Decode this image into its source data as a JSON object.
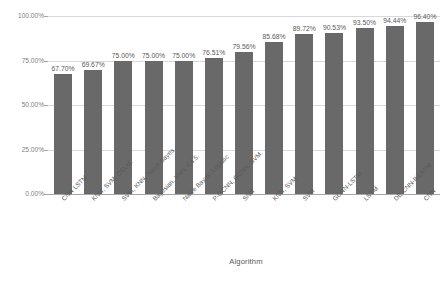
{
  "chart_data": {
    "type": "bar",
    "title": "",
    "xlabel": "Algorithm",
    "ylabel": "Average Accuracy",
    "ylim": [
      0,
      100
    ],
    "grid": true,
    "legend": "none",
    "orientation": "vertical",
    "bar_color": "#696969",
    "value_label_format": "percent-2dp",
    "categories": [
      "CNN LSTM",
      "KNN, SVM, OELM.",
      "SVM, KNN, Naive Bayes.",
      "Bayesian, KNN, C4.5.",
      "Naive Bayes, Logistic",
      "P-GCNN, GCNN, SVM.",
      "SNN",
      "KNN, SVM",
      "SVM",
      "GCNN-LSTM",
      "LSTM",
      "DE-CNN-BiLSTM",
      "CNN"
    ],
    "values": [
      67.7,
      69.67,
      75.0,
      75.0,
      75.0,
      76.51,
      79.56,
      85.68,
      89.72,
      90.53,
      93.5,
      94.44,
      96.4
    ],
    "value_labels": [
      "67.70%",
      "69.67%",
      "75.00%",
      "75.00%",
      "75.00%",
      "76.51%",
      "79.56%",
      "85.68%",
      "89.72%",
      "90.53%",
      "93.50%",
      "94.44%",
      "96.40%"
    ],
    "yticks": [
      0,
      25,
      50,
      75,
      100
    ],
    "ytick_labels": [
      "0.00%",
      "25.00%",
      "50.00%",
      "75.00%",
      "100.00%"
    ]
  }
}
